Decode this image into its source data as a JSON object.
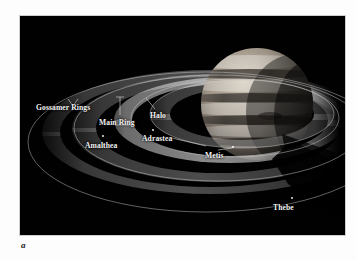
{
  "figure": {
    "panel_letter": "a",
    "background_color": "#ffffff",
    "plate_color": "#000000",
    "label_color": "#f2f2f2",
    "ring_color": "#b9b9b9",
    "orbit_color": "#d8d8d8",
    "planet_color": "#8a8278"
  },
  "labels": [
    {
      "id": "gossamer-rings",
      "text": "Gossamer Rings",
      "x": 16,
      "y": 88
    },
    {
      "id": "main-ring",
      "text": "Main Ring",
      "x": 79,
      "y": 103
    },
    {
      "id": "halo",
      "text": "Halo",
      "x": 130,
      "y": 96
    },
    {
      "id": "amalthea",
      "text": "Amalthea",
      "x": 65,
      "y": 126
    },
    {
      "id": "adrastea",
      "text": "Adrastea",
      "x": 122,
      "y": 119
    },
    {
      "id": "metis",
      "text": "Metis",
      "x": 185,
      "y": 136
    },
    {
      "id": "thebe",
      "text": "Thebe",
      "x": 253,
      "y": 188
    }
  ],
  "scene": {
    "planet_name": "Jupiter",
    "ring_system": [
      "Halo",
      "Main Ring",
      "Gossamer Rings"
    ],
    "moons": [
      "Metis",
      "Adrastea",
      "Amalthea",
      "Thebe"
    ],
    "shadow": "planet shadow cast across rings"
  }
}
